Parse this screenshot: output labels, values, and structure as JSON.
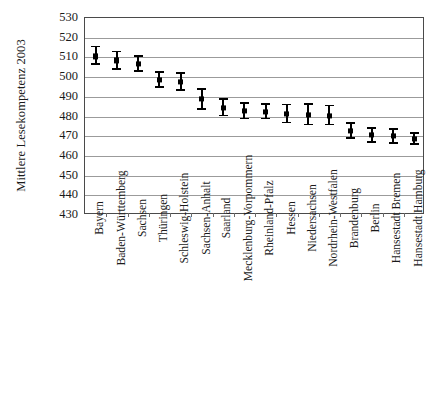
{
  "chart_data": {
    "type": "scatter",
    "title": "",
    "xlabel": "",
    "ylabel": "Mittlere Lesekompetenz 2003",
    "ylim": [
      430,
      530
    ],
    "ytick_step": 10,
    "yticks": [
      530,
      520,
      510,
      500,
      490,
      480,
      470,
      460,
      450,
      440,
      430
    ],
    "grid": true,
    "legend": null,
    "error_bars": "vertical confidence intervals with caps",
    "categories": [
      "Bayern",
      "Baden-Württemberg",
      "Sachsen",
      "Thüringen",
      "Schleswig-Holstein",
      "Sachsen-Anhalt",
      "Saarland",
      "Mecklenburg-Vorpommern",
      "Rheinland-Pfalz",
      "Hessen",
      "Niedersachsen",
      "Nordrhein-Westfalen",
      "Brandenburg",
      "Berlin",
      "Hansestadt Bremen",
      "Hansestadt Hamburg"
    ],
    "values": [
      510.5,
      508.5,
      506.5,
      498.5,
      497.5,
      489.0,
      484.5,
      483.0,
      482.5,
      481.5,
      481.0,
      480.5,
      472.5,
      470.5,
      470.0,
      468.5
    ],
    "err_low": [
      506.0,
      503.5,
      502.5,
      494.5,
      493.0,
      483.5,
      480.0,
      478.5,
      478.5,
      476.5,
      475.5,
      475.5,
      468.5,
      466.5,
      466.0,
      465.5
    ],
    "err_high": [
      516.0,
      513.5,
      511.0,
      503.0,
      502.5,
      494.5,
      489.5,
      487.5,
      487.0,
      486.5,
      487.0,
      486.0,
      477.0,
      474.5,
      474.0,
      472.0
    ],
    "colors": {
      "marker": "#000000",
      "grid": "#9b9b9b",
      "frame": "#4a4a4a",
      "background": "#ffffff"
    }
  }
}
